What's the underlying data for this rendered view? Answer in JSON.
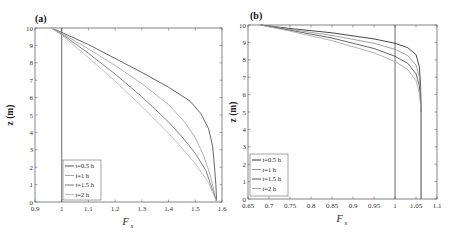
{
  "chart_data": [
    {
      "type": "line",
      "panel_label": "(a)",
      "xlabel": "F",
      "xlabel_sub": "s",
      "ylabel": "z (m)",
      "xlim": [
        0.9,
        1.6
      ],
      "ylim": [
        0,
        10
      ],
      "xticks": [
        0.9,
        1.0,
        1.1,
        1.2,
        1.3,
        1.4,
        1.5,
        1.6
      ],
      "xtick_labels": [
        "0.9",
        "1",
        "1.1",
        "1.2",
        "1.3",
        "1.4",
        "1.5",
        "1.6"
      ],
      "yticks": [
        0,
        1,
        2,
        3,
        4,
        5,
        6,
        7,
        8,
        9,
        10
      ],
      "ytick_labels": [
        "0",
        "1",
        "2",
        "3",
        "4",
        "5",
        "6",
        "7",
        "8",
        "9",
        "10"
      ],
      "reference_line_x": 1.0,
      "legend_position": "bottom-left",
      "series": [
        {
          "name": "t=0.5 h",
          "color": "#555555",
          "points": [
            [
              0.96,
              10
            ],
            [
              1.0,
              9.75
            ],
            [
              1.1,
              9.05
            ],
            [
              1.2,
              8.25
            ],
            [
              1.3,
              7.45
            ],
            [
              1.4,
              6.6
            ],
            [
              1.48,
              5.8
            ],
            [
              1.52,
              5.1
            ],
            [
              1.55,
              4.2
            ],
            [
              1.565,
              3.2
            ],
            [
              1.572,
              2.0
            ],
            [
              1.577,
              1.0
            ],
            [
              1.58,
              0
            ]
          ]
        },
        {
          "name": "t=1 h",
          "color": "#aaaaaa",
          "points": [
            [
              0.96,
              10
            ],
            [
              1.0,
              9.7
            ],
            [
              1.1,
              8.8
            ],
            [
              1.2,
              7.85
            ],
            [
              1.3,
              6.8
            ],
            [
              1.4,
              5.6
            ],
            [
              1.46,
              4.6
            ],
            [
              1.5,
              3.7
            ],
            [
              1.53,
              2.7
            ],
            [
              1.555,
              1.6
            ],
            [
              1.58,
              0
            ]
          ]
        },
        {
          "name": "t=1.5 h",
          "color": "#777777",
          "points": [
            [
              0.96,
              10
            ],
            [
              1.0,
              9.65
            ],
            [
              1.1,
              8.55
            ],
            [
              1.2,
              7.35
            ],
            [
              1.3,
              6.05
            ],
            [
              1.4,
              4.6
            ],
            [
              1.45,
              3.75
            ],
            [
              1.5,
              2.8
            ],
            [
              1.54,
              1.8
            ],
            [
              1.58,
              0
            ]
          ]
        },
        {
          "name": "t=2 h",
          "color": "#bbbbbb",
          "points": [
            [
              0.96,
              10
            ],
            [
              1.0,
              9.6
            ],
            [
              1.1,
              8.3
            ],
            [
              1.2,
              6.95
            ],
            [
              1.3,
              5.5
            ],
            [
              1.4,
              3.95
            ],
            [
              1.45,
              3.1
            ],
            [
              1.5,
              2.2
            ],
            [
              1.55,
              1.1
            ],
            [
              1.58,
              0
            ]
          ]
        }
      ]
    },
    {
      "type": "line",
      "panel_label": "(b)",
      "xlabel": "F",
      "xlabel_sub": "s",
      "ylabel": "z (m)",
      "xlim": [
        0.65,
        1.1
      ],
      "ylim": [
        0,
        10
      ],
      "xticks": [
        0.65,
        0.7,
        0.75,
        0.8,
        0.85,
        0.9,
        0.95,
        1.0,
        1.05,
        1.1
      ],
      "xtick_labels": [
        "0.65",
        "0.7",
        "0.75",
        "0.8",
        "0.85",
        "0.9",
        "0.95",
        "1",
        "1.05",
        "1.1"
      ],
      "yticks": [
        0,
        1,
        2,
        3,
        4,
        5,
        6,
        7,
        8,
        9,
        10
      ],
      "ytick_labels": [
        "0",
        "1",
        "2",
        "3",
        "4",
        "5",
        "6",
        "7",
        "8",
        "9",
        "10"
      ],
      "reference_line_x": 1.0,
      "legend_position": "bottom-left",
      "series": [
        {
          "name": "t=0.5 h",
          "color": "#333333",
          "points": [
            [
              0.68,
              10
            ],
            [
              0.75,
              9.8
            ],
            [
              0.85,
              9.55
            ],
            [
              0.95,
              9.2
            ],
            [
              1.0,
              8.95
            ],
            [
              1.03,
              8.7
            ],
            [
              1.05,
              8.3
            ],
            [
              1.058,
              7.6
            ],
            [
              1.061,
              6.5
            ],
            [
              1.062,
              5.0
            ],
            [
              1.062,
              0
            ]
          ]
        },
        {
          "name": "t=1 h",
          "color": "#999999",
          "points": [
            [
              0.68,
              10
            ],
            [
              0.75,
              9.75
            ],
            [
              0.85,
              9.4
            ],
            [
              0.95,
              8.95
            ],
            [
              1.0,
              8.6
            ],
            [
              1.03,
              8.25
            ],
            [
              1.05,
              7.7
            ],
            [
              1.058,
              7.0
            ],
            [
              1.061,
              6.0
            ],
            [
              1.062,
              5.0
            ]
          ]
        },
        {
          "name": "t=1.5 h",
          "color": "#555555",
          "points": [
            [
              0.68,
              10
            ],
            [
              0.75,
              9.7
            ],
            [
              0.85,
              9.25
            ],
            [
              0.95,
              8.65
            ],
            [
              1.0,
              8.2
            ],
            [
              1.03,
              7.8
            ],
            [
              1.05,
              7.2
            ],
            [
              1.058,
              6.5
            ],
            [
              1.061,
              5.6
            ],
            [
              1.062,
              5.0
            ]
          ]
        },
        {
          "name": "t=2 h",
          "color": "#aaaaaa",
          "points": [
            [
              0.68,
              10
            ],
            [
              0.75,
              9.65
            ],
            [
              0.85,
              9.1
            ],
            [
              0.95,
              8.4
            ],
            [
              1.0,
              7.9
            ],
            [
              1.03,
              7.45
            ],
            [
              1.05,
              6.8
            ],
            [
              1.058,
              6.1
            ],
            [
              1.061,
              5.3
            ],
            [
              1.062,
              4.8
            ]
          ]
        }
      ]
    }
  ]
}
